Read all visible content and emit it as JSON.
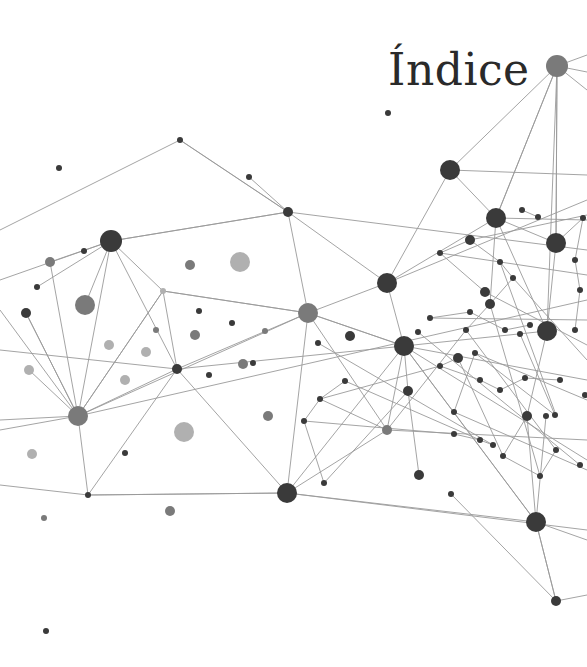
{
  "page": {
    "title": "Índice"
  },
  "graphic": {
    "name": "network-graph",
    "colors": {
      "dark": "#3a3a3a",
      "mid": "#7a7a7a",
      "light": "#b0b0b0",
      "edge": "#9a9a9a"
    },
    "nodes": [
      [
        557,
        66,
        11,
        "mid"
      ],
      [
        180,
        140,
        3,
        "dark"
      ],
      [
        388,
        113,
        3,
        "dark"
      ],
      [
        59,
        168,
        3,
        "dark"
      ],
      [
        249,
        177,
        3,
        "dark"
      ],
      [
        450,
        170,
        10,
        "dark"
      ],
      [
        288,
        212,
        5,
        "dark"
      ],
      [
        496,
        218,
        10,
        "dark"
      ],
      [
        111,
        241,
        11,
        "dark"
      ],
      [
        50,
        262,
        5,
        "mid"
      ],
      [
        84,
        251,
        3,
        "dark"
      ],
      [
        190,
        265,
        5,
        "mid"
      ],
      [
        240,
        262,
        10,
        "light"
      ],
      [
        556,
        243,
        10,
        "dark"
      ],
      [
        37,
        287,
        3,
        "dark"
      ],
      [
        85,
        305,
        10,
        "mid"
      ],
      [
        26,
        313,
        5,
        "dark"
      ],
      [
        163,
        291,
        3,
        "light"
      ],
      [
        387,
        283,
        10,
        "dark"
      ],
      [
        308,
        313,
        10,
        "mid"
      ],
      [
        199,
        311,
        3,
        "dark"
      ],
      [
        156,
        330,
        3,
        "mid"
      ],
      [
        109,
        345,
        5,
        "light"
      ],
      [
        146,
        352,
        5,
        "light"
      ],
      [
        195,
        335,
        5,
        "mid"
      ],
      [
        232,
        323,
        3,
        "dark"
      ],
      [
        253,
        363,
        3,
        "dark"
      ],
      [
        243,
        364,
        5,
        "mid"
      ],
      [
        265,
        331,
        3,
        "mid"
      ],
      [
        350,
        336,
        5,
        "dark"
      ],
      [
        404,
        346,
        10,
        "dark"
      ],
      [
        547,
        331,
        10,
        "dark"
      ],
      [
        177,
        369,
        5,
        "dark"
      ],
      [
        125,
        380,
        5,
        "light"
      ],
      [
        29,
        370,
        5,
        "light"
      ],
      [
        209,
        375,
        3,
        "dark"
      ],
      [
        78,
        416,
        10,
        "mid"
      ],
      [
        184,
        432,
        10,
        "light"
      ],
      [
        268,
        416,
        5,
        "mid"
      ],
      [
        125,
        453,
        3,
        "dark"
      ],
      [
        32,
        454,
        5,
        "light"
      ],
      [
        387,
        430,
        5,
        "mid"
      ],
      [
        408,
        391,
        5,
        "dark"
      ],
      [
        419,
        475,
        5,
        "dark"
      ],
      [
        287,
        493,
        10,
        "dark"
      ],
      [
        88,
        495,
        3,
        "dark"
      ],
      [
        170,
        511,
        5,
        "mid"
      ],
      [
        44,
        518,
        3,
        "mid"
      ],
      [
        536,
        522,
        10,
        "dark"
      ],
      [
        556,
        601,
        5,
        "dark"
      ],
      [
        46,
        631,
        3,
        "dark"
      ],
      [
        451,
        494,
        3,
        "dark"
      ],
      [
        527,
        416,
        5,
        "dark"
      ],
      [
        546,
        416,
        3,
        "dark"
      ],
      [
        475,
        353,
        3,
        "dark"
      ],
      [
        490,
        304,
        5,
        "dark"
      ],
      [
        485,
        292,
        5,
        "dark"
      ],
      [
        440,
        253,
        3,
        "dark"
      ],
      [
        470,
        240,
        5,
        "dark"
      ],
      [
        466,
        330,
        3,
        "dark"
      ],
      [
        520,
        334,
        3,
        "dark"
      ],
      [
        555,
        415,
        3,
        "dark"
      ],
      [
        503,
        456,
        3,
        "dark"
      ],
      [
        540,
        476,
        3,
        "dark"
      ],
      [
        556,
        450,
        3,
        "dark"
      ],
      [
        458,
        358,
        5,
        "dark"
      ],
      [
        440,
        366,
        3,
        "dark"
      ],
      [
        480,
        380,
        3,
        "dark"
      ],
      [
        500,
        390,
        3,
        "dark"
      ],
      [
        525,
        378,
        3,
        "dark"
      ],
      [
        560,
        380,
        3,
        "dark"
      ],
      [
        575,
        330,
        3,
        "dark"
      ],
      [
        580,
        290,
        3,
        "dark"
      ],
      [
        575,
        260,
        3,
        "dark"
      ],
      [
        583,
        218,
        3,
        "dark"
      ],
      [
        522,
        210,
        3,
        "dark"
      ],
      [
        538,
        217,
        3,
        "dark"
      ],
      [
        500,
        262,
        3,
        "dark"
      ],
      [
        513,
        278,
        3,
        "dark"
      ],
      [
        318,
        343,
        3,
        "dark"
      ],
      [
        345,
        381,
        3,
        "dark"
      ],
      [
        320,
        399,
        3,
        "dark"
      ],
      [
        304,
        421,
        3,
        "dark"
      ],
      [
        324,
        483,
        3,
        "dark"
      ],
      [
        454,
        434,
        3,
        "dark"
      ],
      [
        480,
        440,
        3,
        "dark"
      ],
      [
        493,
        445,
        3,
        "dark"
      ],
      [
        418,
        332,
        3,
        "dark"
      ],
      [
        430,
        318,
        3,
        "dark"
      ],
      [
        470,
        312,
        3,
        "dark"
      ],
      [
        505,
        330,
        3,
        "dark"
      ],
      [
        530,
        325,
        3,
        "dark"
      ],
      [
        580,
        465,
        3,
        "dark"
      ],
      [
        585,
        395,
        3,
        "dark"
      ],
      [
        454,
        412,
        3,
        "dark"
      ]
    ],
    "edges": [
      [
        0,
        5
      ],
      [
        0,
        7
      ],
      [
        0,
        13
      ],
      [
        0,
        31
      ],
      [
        5,
        7
      ],
      [
        5,
        18
      ],
      [
        7,
        13
      ],
      [
        1,
        249
      ],
      [
        1,
        6
      ],
      [
        6,
        8
      ],
      [
        6,
        19
      ],
      [
        6,
        18
      ],
      [
        8,
        9
      ],
      [
        8,
        15
      ],
      [
        8,
        36
      ],
      [
        8,
        17
      ],
      [
        8,
        14
      ],
      [
        17,
        19
      ],
      [
        17,
        32
      ],
      [
        17,
        36
      ],
      [
        19,
        36
      ],
      [
        19,
        44
      ],
      [
        19,
        18
      ],
      [
        19,
        30
      ],
      [
        32,
        36
      ],
      [
        32,
        44
      ],
      [
        32,
        19
      ],
      [
        36,
        45
      ],
      [
        36,
        16
      ],
      [
        36,
        34
      ],
      [
        45,
        44
      ],
      [
        44,
        30
      ],
      [
        44,
        41
      ],
      [
        44,
        48
      ],
      [
        30,
        48
      ],
      [
        30,
        41
      ],
      [
        30,
        18
      ],
      [
        30,
        31
      ],
      [
        30,
        42
      ],
      [
        18,
        7
      ],
      [
        48,
        49
      ],
      [
        48,
        52
      ],
      [
        48,
        53
      ],
      [
        52,
        31
      ],
      [
        31,
        13
      ],
      [
        7,
        31
      ],
      [
        13,
        74
      ],
      [
        7,
        55
      ],
      [
        55,
        59
      ],
      [
        59,
        41
      ],
      [
        41,
        81
      ],
      [
        42,
        43
      ],
      [
        80,
        81
      ],
      [
        81,
        82
      ],
      [
        82,
        83
      ],
      [
        84,
        85
      ],
      [
        85,
        86
      ],
      [
        52,
        62
      ],
      [
        62,
        63
      ],
      [
        63,
        64
      ],
      [
        65,
        66
      ],
      [
        66,
        67
      ],
      [
        67,
        68
      ],
      [
        68,
        69
      ],
      [
        69,
        70
      ],
      [
        71,
        72
      ],
      [
        72,
        73
      ],
      [
        73,
        74
      ],
      [
        75,
        76
      ],
      [
        77,
        78
      ],
      [
        78,
        55
      ],
      [
        88,
        89
      ],
      [
        89,
        90
      ],
      [
        90,
        91
      ],
      [
        56,
        57
      ],
      [
        57,
        58
      ],
      [
        58,
        77
      ],
      [
        60,
        61
      ],
      [
        61,
        54
      ],
      [
        94,
        54
      ]
    ]
  }
}
